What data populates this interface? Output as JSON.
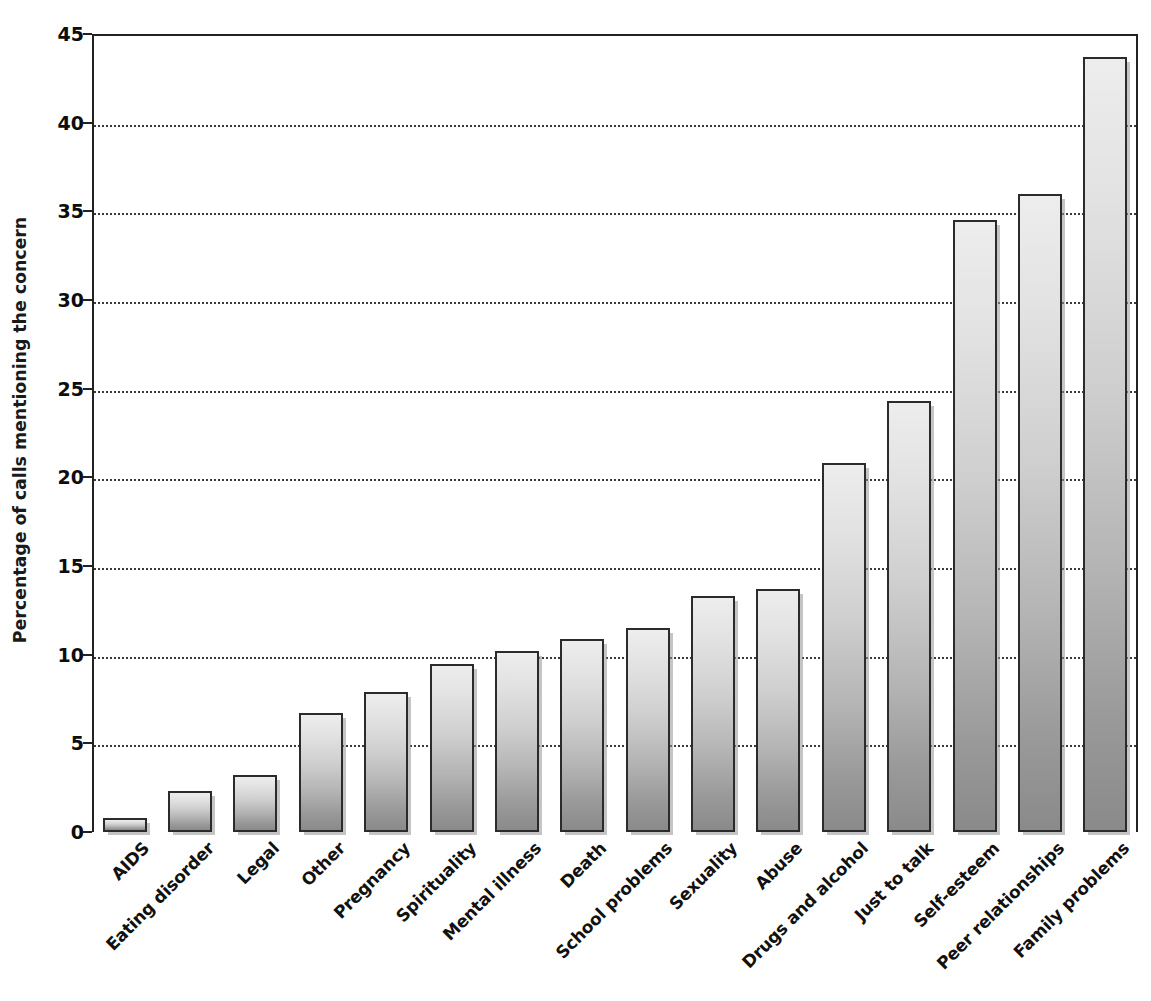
{
  "chart_data": {
    "type": "bar",
    "title": "",
    "subtitle": "",
    "xlabel": "",
    "ylabel": "Percentage of calls mentioning the concern",
    "ylim": [
      0,
      45
    ],
    "yticks": [
      0,
      5,
      10,
      15,
      20,
      25,
      30,
      35,
      40,
      45
    ],
    "ytick_labels": [
      "0",
      "5",
      "10",
      "15",
      "20",
      "25",
      "30",
      "35",
      "40",
      "45"
    ],
    "grid": "horizontal-dotted",
    "legend": "none",
    "annotations": [],
    "categories": [
      "AIDS",
      "Eating disorder",
      "Legal",
      "Other",
      "Pregnancy",
      "Spirituality",
      "Mental illness",
      "Death",
      "School problems",
      "Sexuality",
      "Abuse",
      "Drugs and alcohol",
      "Just to talk",
      "Self-esteem",
      "Peer relationships",
      "Family problems"
    ],
    "values": [
      0.8,
      2.3,
      3.2,
      6.7,
      7.9,
      9.5,
      10.2,
      10.9,
      11.5,
      13.3,
      13.7,
      20.8,
      24.3,
      34.5,
      36.0,
      43.7
    ],
    "bar_style": {
      "fill_top_color": "#ededed",
      "fill_bottom_color": "#8a8a8a",
      "border_color": "#2b2b2b",
      "shadow_color": "#969696"
    },
    "axis_color": "#222222",
    "gridline_color": "#3a3a3a",
    "background_color": "#ffffff"
  }
}
